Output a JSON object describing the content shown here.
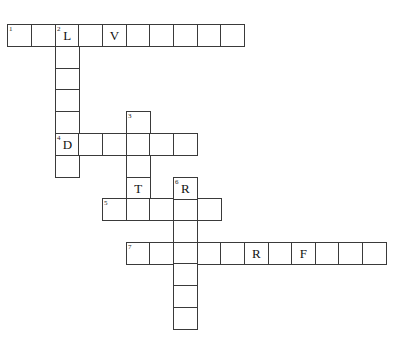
{
  "puzzle": {
    "type": "crossword",
    "cell": {
      "width": 23.7,
      "height": 21.8
    },
    "col_x": [
      7,
      31,
      55,
      78,
      102,
      126,
      149,
      173,
      197,
      220,
      244,
      268,
      291,
      315,
      338,
      362
    ],
    "row_y": [
      24,
      46,
      68,
      89,
      111,
      133,
      155,
      177,
      198,
      220,
      242,
      263,
      285,
      307
    ],
    "entries": [
      {
        "number": "1",
        "direction": "across",
        "row": 0,
        "col": 0,
        "length": 10,
        "letters": {
          "2": "L",
          "4": "V"
        }
      },
      {
        "number": "2",
        "direction": "down",
        "row": 0,
        "col": 2,
        "length": 7,
        "letters": {
          "0": "L",
          "5": "D"
        }
      },
      {
        "number": "3",
        "direction": "down",
        "row": 4,
        "col": 5,
        "length": 4,
        "letters": {
          "3": "T"
        }
      },
      {
        "number": "4",
        "direction": "across",
        "row": 5,
        "col": 2,
        "length": 6,
        "letters": {
          "0": "D"
        }
      },
      {
        "number": "5",
        "direction": "across",
        "row": 8,
        "col": 4,
        "length": 5,
        "letters": {}
      },
      {
        "number": "6",
        "direction": "down",
        "row": 7,
        "col": 7,
        "length": 7,
        "letters": {
          "0": "R"
        }
      },
      {
        "number": "7",
        "direction": "across",
        "row": 10,
        "col": 5,
        "length": 11,
        "letters": {
          "5": "R",
          "7": "F"
        }
      }
    ]
  }
}
